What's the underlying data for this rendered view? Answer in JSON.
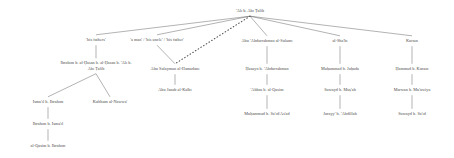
{
  "diagram": {
    "type": "isnad-transmission-tree",
    "title": "",
    "root": {
      "id": "ali",
      "label": "'Alī b. Abī Ṭālib",
      "x": 250,
      "y": 11
    },
    "nodes": [
      {
        "id": "his-fathers",
        "label": "'his fathers'",
        "x": 96,
        "y": 40,
        "column": 1,
        "level": 1
      },
      {
        "id": "a-man",
        "label": "'a man' / 'his uncle' / 'his father'",
        "x": 157,
        "y": 40,
        "column": 2,
        "level": 1
      },
      {
        "id": "abu-abdurrahman",
        "label": "Abū 'Abdurrahmān al-Sulamī",
        "x": 267,
        "y": 41,
        "column": 3,
        "level": 1
      },
      {
        "id": "al-shabi",
        "label": "al-Sha'bī",
        "x": 340,
        "y": 41,
        "column": 4,
        "level": 1
      },
      {
        "id": "kurayb",
        "label": "Kuraīn",
        "x": 412,
        "y": 41,
        "column": 5,
        "level": 1
      },
      {
        "id": "ibrahim-hasan",
        "label": "Ibrāhīm b. al-Ḥasan b. al-Ḥasan b. 'Alī b. Abī Ṭālib",
        "x": 96,
        "y": 66,
        "column": 1,
        "level": 2,
        "twoLine": true
      },
      {
        "id": "abu-sulayman",
        "label": "Abū Sulaymān al-Hamadānī",
        "x": 175,
        "y": 69,
        "column": 2,
        "level": 2
      },
      {
        "id": "husayn",
        "label": "Ḥusayn b. 'Abdurrahmān",
        "x": 267,
        "y": 69,
        "column": 3,
        "level": 2
      },
      {
        "id": "muhammad-juhada",
        "label": "Muḥammad b. Juḥāda",
        "x": 340,
        "y": 69,
        "column": 4,
        "level": 2
      },
      {
        "id": "hammad-kurayb",
        "label": "Ḥammād b. Kuraīn",
        "x": 412,
        "y": 69,
        "column": 5,
        "level": 2
      },
      {
        "id": "ismail",
        "label": "Ismā'īl b. Ibrāhīm",
        "x": 48,
        "y": 102,
        "column": 1,
        "level": 3
      },
      {
        "id": "kulthum",
        "label": "Kulthūm al-Nawwā'",
        "x": 110,
        "y": 102,
        "column": 1,
        "level": 3
      },
      {
        "id": "abu-janab",
        "label": "Abū Janāb al-Kalbī",
        "x": 175,
        "y": 90,
        "column": 2,
        "level": 3
      },
      {
        "id": "abbas-qasim",
        "label": "'Abbās b. al-Qāsim",
        "x": 267,
        "y": 90,
        "column": 3,
        "level": 3
      },
      {
        "id": "suwayd-musab",
        "label": "Suwayd b. Muṣ'ab",
        "x": 340,
        "y": 90,
        "column": 4,
        "level": 3
      },
      {
        "id": "marwan",
        "label": "Marwān b. Mu'āwiya",
        "x": 412,
        "y": 90,
        "column": 5,
        "level": 3
      },
      {
        "id": "muhammad-said",
        "label": "Muḥammad b. Sa'īd/As'ad",
        "x": 267,
        "y": 114,
        "column": 3,
        "level": 4
      },
      {
        "id": "jurayy",
        "label": "Jurayy' b. 'Abdillāh",
        "x": 340,
        "y": 114,
        "column": 4,
        "level": 4
      },
      {
        "id": "suwayd-said",
        "label": "Suwayd b. Sa'īd",
        "x": 412,
        "y": 114,
        "column": 5,
        "level": 4
      },
      {
        "id": "ibrahim-ismail",
        "label": "Ibrāhīm b. Ismā'īl",
        "x": 48,
        "y": 124,
        "column": 1,
        "level": 4
      },
      {
        "id": "qasim-ibrahim",
        "label": "al-Qāsim b. Ibrāhīm",
        "x": 48,
        "y": 146,
        "column": 1,
        "level": 5
      }
    ],
    "edges": [
      {
        "from": "ali",
        "to": "his-fathers",
        "style": "solid"
      },
      {
        "from": "ali",
        "to": "a-man",
        "style": "solid"
      },
      {
        "from": "ali",
        "to": "abu-abdurrahman",
        "style": "solid"
      },
      {
        "from": "ali",
        "to": "al-shabi",
        "style": "solid"
      },
      {
        "from": "ali",
        "to": "kurayb",
        "style": "solid"
      },
      {
        "from": "ali",
        "to": "abu-sulayman",
        "style": "dotted"
      },
      {
        "from": "his-fathers",
        "to": "ibrahim-hasan",
        "style": "solid"
      },
      {
        "from": "ibrahim-hasan",
        "to": "ismail",
        "style": "solid"
      },
      {
        "from": "ibrahim-hasan",
        "to": "kulthum",
        "style": "solid"
      },
      {
        "from": "ismail",
        "to": "ibrahim-ismail",
        "style": "solid"
      },
      {
        "from": "ibrahim-ismail",
        "to": "qasim-ibrahim",
        "style": "solid"
      },
      {
        "from": "a-man",
        "to": "abu-sulayman",
        "style": "solid"
      },
      {
        "from": "abu-sulayman",
        "to": "abu-janab",
        "style": "solid"
      },
      {
        "from": "abu-abdurrahman",
        "to": "husayn",
        "style": "solid"
      },
      {
        "from": "husayn",
        "to": "abbas-qasim",
        "style": "solid"
      },
      {
        "from": "abbas-qasim",
        "to": "muhammad-said",
        "style": "solid"
      },
      {
        "from": "al-shabi",
        "to": "muhammad-juhada",
        "style": "solid"
      },
      {
        "from": "muhammad-juhada",
        "to": "suwayd-musab",
        "style": "solid"
      },
      {
        "from": "suwayd-musab",
        "to": "jurayy",
        "style": "solid"
      },
      {
        "from": "kurayb",
        "to": "hammad-kurayb",
        "style": "solid"
      },
      {
        "from": "hammad-kurayb",
        "to": "marwan",
        "style": "solid"
      },
      {
        "from": "marwan",
        "to": "suwayd-said",
        "style": "solid"
      }
    ],
    "colors": {
      "text": "#4a4a4a",
      "line": "#555555",
      "background": "#ffffff"
    }
  }
}
